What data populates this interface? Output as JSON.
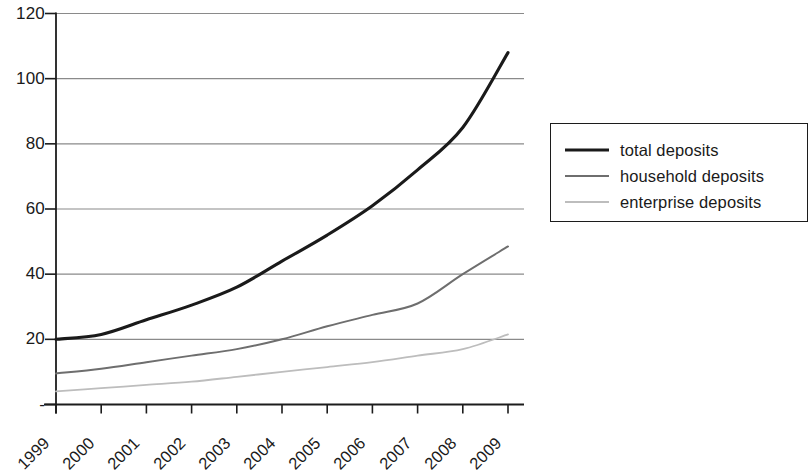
{
  "chart_data": {
    "type": "line",
    "title": "",
    "subtitle": "",
    "xlabel": "",
    "ylabel": "",
    "categories": [
      "1999",
      "2000",
      "2001",
      "2002",
      "2003",
      "2004",
      "2005",
      "2006",
      "2007",
      "2008",
      "2009"
    ],
    "ylim": [
      0,
      120
    ],
    "yticks": [
      0,
      20,
      40,
      60,
      80,
      100,
      120
    ],
    "ytick_labels": [
      "-",
      "20",
      "40",
      "60",
      "80",
      "100",
      "120"
    ],
    "grid": "horizontal",
    "legend_position": "right",
    "series": [
      {
        "name": "total deposits",
        "color": "#1a1a1a",
        "width": 3.1,
        "values": [
          20,
          21.5,
          26,
          30.5,
          36,
          44,
          52,
          61,
          72,
          85,
          108
        ]
      },
      {
        "name": "household deposits",
        "color": "#6e6e6e",
        "width": 2.0,
        "values": [
          9.5,
          11,
          13,
          15,
          17,
          20,
          24,
          27.5,
          31,
          40,
          48.5
        ]
      },
      {
        "name": "enterprise deposits",
        "color": "#bdbdbd",
        "width": 1.8,
        "values": [
          4,
          5,
          6,
          7,
          8.5,
          10,
          11.5,
          13,
          15,
          17,
          21.5
        ]
      }
    ]
  },
  "axis": {
    "line_color": "#1c1c1c",
    "grid_color": "#8a8a8a"
  },
  "legend": {
    "items": [
      {
        "label": "total deposits"
      },
      {
        "label": "household deposits"
      },
      {
        "label": "enterprise deposits"
      }
    ]
  }
}
